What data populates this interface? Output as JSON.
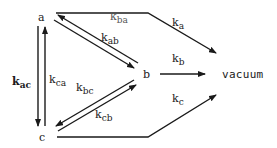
{
  "diagram": {
    "type": "kinetic-scheme",
    "nodes": [
      {
        "id": "a",
        "label": "a"
      },
      {
        "id": "b",
        "label": "b"
      },
      {
        "id": "c",
        "label": "c"
      },
      {
        "id": "vacuum",
        "label": "vacuum"
      }
    ],
    "edges": [
      {
        "from": "a",
        "to": "b",
        "label_k": "k",
        "label_sub": "ab"
      },
      {
        "from": "b",
        "to": "a",
        "label_k": "k",
        "label_sub": "ba"
      },
      {
        "from": "a",
        "to": "c",
        "label_k": "k",
        "label_sub": "ac"
      },
      {
        "from": "c",
        "to": "a",
        "label_k": "k",
        "label_sub": "ca"
      },
      {
        "from": "b",
        "to": "c",
        "label_k": "k",
        "label_sub": "bc"
      },
      {
        "from": "c",
        "to": "b",
        "label_k": "k",
        "label_sub": "cb"
      },
      {
        "from": "a",
        "to": "vacuum",
        "label_k": "k",
        "label_sub": "a"
      },
      {
        "from": "b",
        "to": "vacuum",
        "label_k": "k",
        "label_sub": "b"
      },
      {
        "from": "c",
        "to": "vacuum",
        "label_k": "k",
        "label_sub": "c"
      }
    ]
  },
  "colors": {
    "ink": "#1a1a1a",
    "background": "#ffffff"
  }
}
